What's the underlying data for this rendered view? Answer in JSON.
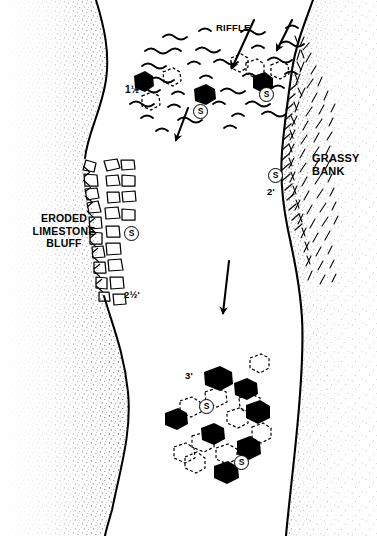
{
  "figure": {
    "flow_direction": "downstream (toward bottom of page)"
  },
  "labels": {
    "riffle": "RIFFLE",
    "grassy_bank": "GRASSY\nBANK",
    "eroded_bluff": "ERODED\nLIMESTONE\nBLUFF"
  },
  "depths": [
    {
      "id": "depth-riffle",
      "value": "1½",
      "x": 125,
      "y": 84
    },
    {
      "id": "depth-bluff",
      "value": "2½'",
      "x": 124,
      "y": 289
    },
    {
      "id": "depth-grassy",
      "value": "2'",
      "x": 267,
      "y": 186
    },
    {
      "id": "depth-pool",
      "value": "3'",
      "x": 185,
      "y": 370
    }
  ],
  "structure_markers": {
    "glyph": "S",
    "meaning": "structure / holding spot",
    "positions": [
      {
        "id": "s-riffle-left",
        "x": 193,
        "y": 104
      },
      {
        "id": "s-riffle-right",
        "x": 259,
        "y": 87
      },
      {
        "id": "s-grassy-bank",
        "x": 268,
        "y": 168
      },
      {
        "id": "s-bluff",
        "x": 124,
        "y": 226
      },
      {
        "id": "s-pool-upper",
        "x": 199,
        "y": 399
      },
      {
        "id": "s-pool-lower",
        "x": 234,
        "y": 455
      }
    ]
  },
  "flow_arrows": [
    {
      "id": "arrow-riffle-left",
      "x1": 254,
      "y1": 20,
      "x2": 232,
      "y2": 68
    },
    {
      "id": "arrow-riffle-right",
      "x1": 292,
      "y1": 20,
      "x2": 277,
      "y2": 50
    },
    {
      "id": "arrow-midstream",
      "x1": 188,
      "y1": 108,
      "x2": 176,
      "y2": 140
    },
    {
      "id": "arrow-center-pool",
      "x1": 229,
      "y1": 261,
      "x2": 223,
      "y2": 313
    }
  ],
  "colors": {
    "ink": "#000000",
    "paper": "#ffffff",
    "stipple": "#1a1a1a"
  }
}
